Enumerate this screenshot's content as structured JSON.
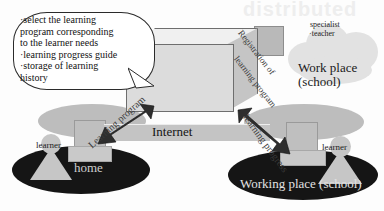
{
  "figure": {
    "watermark_text": "distributed",
    "system_name": "RAPSODY",
    "internet_label": "Internet"
  },
  "callout": {
    "lines": [
      "·select the learning",
      "program corresponding",
      "to the learner needs",
      "·learning progress guide",
      "·storage of learning",
      "history"
    ]
  },
  "home_site": {
    "ground_label": "home",
    "person_label": "learner"
  },
  "school_site": {
    "ground_label": "Working place (school)",
    "person_label": "learner"
  },
  "cloud": {
    "role_line1": "specialist",
    "role_line2": "·teacher",
    "place_line1": "Work place",
    "place_line2": "(school)"
  },
  "arrow_labels": {
    "learning_program": "Learning program",
    "registration_line1": "Registration of",
    "registration_line2": "learning program",
    "learning_progress": "learning progress"
  },
  "colors": {
    "ground": "#151515",
    "desk": "#bdbdbd",
    "person": "#c6c6c6",
    "cube_front": "#dcdcdc",
    "cube_top": "#f0f0f0",
    "cube_side": "#c5c5c5",
    "cloud": "#e2e2e2",
    "arrow": "#2e2e2e",
    "internet_band": "#c4c4c4",
    "outline": "#2b2b2b"
  }
}
